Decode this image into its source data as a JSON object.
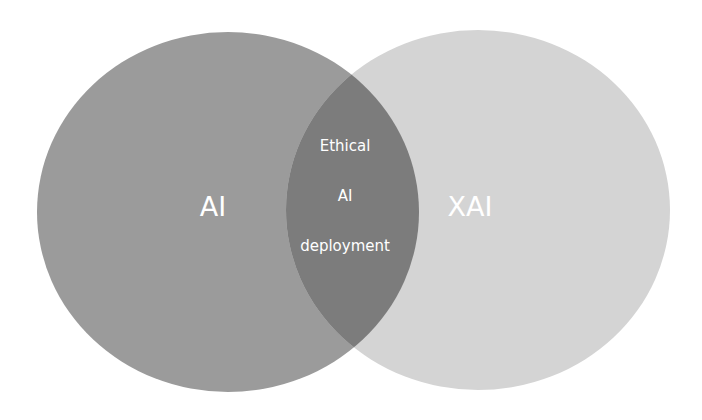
{
  "diagram": {
    "type": "venn",
    "sets": [
      {
        "name": "AI",
        "label": "AI",
        "color": "#9b9b9b"
      },
      {
        "name": "XAI",
        "label": "XAI",
        "color": "#d4d4d4"
      }
    ],
    "intersection": {
      "color": "#7c7c7c",
      "lines": [
        "Ethical",
        "AI",
        "deployment"
      ]
    }
  }
}
